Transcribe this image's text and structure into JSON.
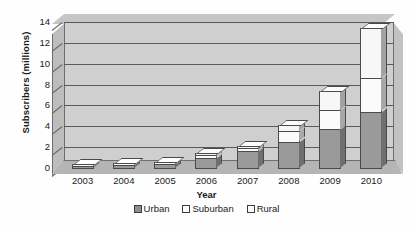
{
  "chart_data": {
    "type": "bar",
    "subtype": "stacked-column-3d",
    "title": "",
    "xlabel": "Year",
    "ylabel": "Subscribers (millions)",
    "categories": [
      "2003",
      "2004",
      "2005",
      "2006",
      "2007",
      "2008",
      "2009",
      "2010"
    ],
    "series": [
      {
        "name": "Urban",
        "color": "#9a9a9a",
        "values": [
          0.3,
          0.4,
          0.5,
          1.1,
          1.7,
          2.6,
          3.8,
          5.5
        ]
      },
      {
        "name": "Suburban",
        "color": "#fbfbfb",
        "values": [
          0.05,
          0.1,
          0.1,
          0.2,
          0.3,
          1.0,
          1.9,
          3.2
        ]
      },
      {
        "name": "Rural",
        "color": "#f7f7f7",
        "values": [
          0.0,
          0.0,
          0.0,
          0.05,
          0.15,
          0.6,
          1.8,
          4.8
        ]
      }
    ],
    "totals": [
      0.35,
      0.5,
      0.6,
      1.35,
      2.15,
      4.2,
      7.5,
      13.5
    ],
    "ylim": [
      0,
      14
    ],
    "ytick_step": 2,
    "yticks": [
      "0",
      "2",
      "4",
      "6",
      "8",
      "10",
      "12",
      "14"
    ],
    "grid": true,
    "legend_position": "bottom"
  },
  "axes": {
    "y_title": "Subscribers (millions)",
    "x_title": "Year"
  },
  "legend": {
    "items": [
      {
        "label": "Urban",
        "swatch": "urban-swatch-icon"
      },
      {
        "label": "Suburban",
        "swatch": "suburban-swatch-icon"
      },
      {
        "label": "Rural",
        "swatch": "rural-swatch-icon"
      }
    ]
  },
  "colors": {
    "urban": "#9a9a9a",
    "suburban": "#fbfbfb",
    "rural": "#f7f7f7",
    "plot_background": "#cfcfcf",
    "floor": "#b5b5b5",
    "gridline": "#5a5a5a",
    "text": "#1a1a1a"
  }
}
